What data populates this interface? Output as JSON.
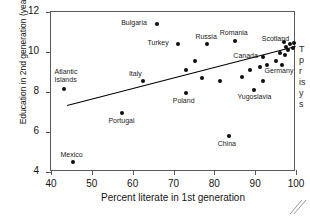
{
  "chart_data": {
    "type": "scatter",
    "title": "",
    "xlabel": "Percent literate in 1st generation",
    "ylabel": "Education in 2nd generation (years)",
    "xlim": [
      40,
      100
    ],
    "ylim": [
      4,
      12
    ],
    "xticks": [
      40,
      50,
      60,
      70,
      80,
      90,
      100
    ],
    "yticks": [
      4,
      6,
      8,
      10,
      12
    ],
    "grid": false,
    "legend": "none",
    "marker_color": "#0d0d0d",
    "trendline": {
      "type": "linear",
      "x": [
        44,
        100
      ],
      "y": [
        7.35,
        10.3
      ],
      "color": "#000000"
    },
    "points": [
      {
        "label": "Mexico",
        "x": 45.5,
        "y": 4.5,
        "lx": -13,
        "ly": -11
      },
      {
        "label": "Atlantic\nIslands",
        "x": 43.3,
        "y": 8.15,
        "lx": -10,
        "ly": -21
      },
      {
        "label": "Portugal",
        "x": 57.5,
        "y": 6.95,
        "lx": -14,
        "ly": 4
      },
      {
        "label": "Italy",
        "x": 62.5,
        "y": 8.55,
        "lx": -14,
        "ly": -11
      },
      {
        "label": "Poland",
        "x": 73.0,
        "y": 7.95,
        "lx": -13,
        "ly": 4
      },
      {
        "label": "Turkey",
        "x": 71.0,
        "y": 10.4,
        "lx": -30,
        "ly": -5
      },
      {
        "label": "Bulgaria",
        "x": 66.0,
        "y": 11.4,
        "lx": -36,
        "ly": -5
      },
      {
        "label": "Russia",
        "x": 78.3,
        "y": 10.4,
        "lx": -12,
        "ly": -11
      },
      {
        "label": "Romania",
        "x": 85.0,
        "y": 10.55,
        "lx": -15,
        "ly": -12
      },
      {
        "label": "Canada",
        "x": 92.0,
        "y": 9.75,
        "lx": -30,
        "ly": -5
      },
      {
        "label": "Scotland",
        "x": 97.5,
        "y": 10.25,
        "lx": -24,
        "ly": -12
      },
      {
        "label": "Germany",
        "x": 92.8,
        "y": 9.35,
        "lx": -2,
        "ly": 2
      },
      {
        "label": "Yugoslavia",
        "x": 89.6,
        "y": 8.1,
        "lx": -16,
        "ly": 3
      },
      {
        "label": "China",
        "x": 83.5,
        "y": 5.8,
        "lx": -11,
        "ly": 4
      },
      {
        "label": "",
        "x": 75.3,
        "y": 9.55,
        "lx": 0,
        "ly": 0
      },
      {
        "label": "",
        "x": 73.0,
        "y": 9.1,
        "lx": 0,
        "ly": 0
      },
      {
        "label": "",
        "x": 77.0,
        "y": 8.7,
        "lx": 0,
        "ly": 0
      },
      {
        "label": "",
        "x": 81.5,
        "y": 8.55,
        "lx": 0,
        "ly": 0
      },
      {
        "label": "",
        "x": 86.8,
        "y": 8.75,
        "lx": 0,
        "ly": 0
      },
      {
        "label": "",
        "x": 88.7,
        "y": 9.1,
        "lx": 0,
        "ly": 0
      },
      {
        "label": "",
        "x": 91.3,
        "y": 9.25,
        "lx": 0,
        "ly": 0
      },
      {
        "label": "",
        "x": 92.0,
        "y": 8.55,
        "lx": 0,
        "ly": 0
      },
      {
        "label": "",
        "x": 95.0,
        "y": 9.55,
        "lx": 0,
        "ly": 0
      },
      {
        "label": "",
        "x": 96.2,
        "y": 9.95,
        "lx": 0,
        "ly": 0
      },
      {
        "label": "",
        "x": 97.0,
        "y": 10.5,
        "lx": 0,
        "ly": 0
      },
      {
        "label": "",
        "x": 98.0,
        "y": 10.1,
        "lx": 0,
        "ly": 0
      },
      {
        "label": "",
        "x": 98.6,
        "y": 10.4,
        "lx": 0,
        "ly": 0
      },
      {
        "label": "",
        "x": 99.2,
        "y": 10.2,
        "lx": 0,
        "ly": 0
      },
      {
        "label": "",
        "x": 99.6,
        "y": 10.45,
        "lx": 0,
        "ly": 0
      },
      {
        "label": "",
        "x": 96.5,
        "y": 9.35,
        "lx": 0,
        "ly": 0
      },
      {
        "label": "",
        "x": 97.4,
        "y": 9.85,
        "lx": 0,
        "ly": 0
      }
    ]
  },
  "side_caption": {
    "lines": [
      "T",
      "p",
      "r",
      "is",
      "y",
      "s"
    ]
  }
}
